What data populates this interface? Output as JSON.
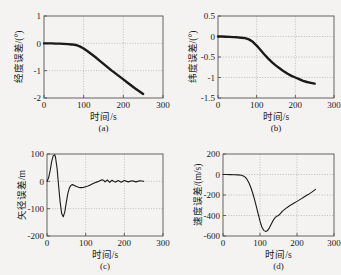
{
  "figure": {
    "background": "#f4f3f1",
    "curve_color": "#1a1a1a",
    "grid_color": "#9a9a9a",
    "axis_color": "#555555",
    "xlabel": "时间/s",
    "panels": [
      "a",
      "b",
      "c",
      "d"
    ]
  },
  "chart_data": [
    {
      "type": "line",
      "panel": "(a)",
      "title": "",
      "xlabel": "时间/s",
      "ylabel": "经度误差/(°)",
      "xlim": [
        0,
        300
      ],
      "ylim": [
        -2,
        1
      ],
      "xticks": [
        0,
        100,
        200,
        300
      ],
      "yticks": [
        -2,
        -1,
        0,
        1
      ],
      "xticklabels": [
        "0",
        "100",
        "200",
        "300"
      ],
      "yticklabels": [
        "-2",
        "-1",
        "0",
        "1"
      ],
      "grid": true,
      "legend": "none",
      "series": [
        {
          "name": "经度误差",
          "x": [
            0,
            10,
            20,
            30,
            40,
            50,
            60,
            70,
            80,
            90,
            100,
            110,
            120,
            130,
            140,
            150,
            160,
            170,
            180,
            190,
            200,
            210,
            220,
            230,
            240,
            250
          ],
          "values": [
            0,
            0,
            0,
            -0.01,
            -0.01,
            -0.02,
            -0.03,
            -0.04,
            -0.06,
            -0.11,
            -0.19,
            -0.29,
            -0.4,
            -0.51,
            -0.63,
            -0.75,
            -0.87,
            -0.99,
            -1.1,
            -1.21,
            -1.32,
            -1.43,
            -1.54,
            -1.65,
            -1.75,
            -1.85
          ]
        }
      ]
    },
    {
      "type": "line",
      "panel": "(b)",
      "title": "",
      "xlabel": "时间/s",
      "ylabel": "纬度误差/(°)",
      "xlim": [
        0,
        300
      ],
      "ylim": [
        -1.5,
        0.5
      ],
      "xticks": [
        0,
        100,
        200,
        300
      ],
      "yticks": [
        -1.5,
        -1,
        -0.5,
        0,
        0.5
      ],
      "xticklabels": [
        "0",
        "100",
        "200",
        "300"
      ],
      "yticklabels": [
        "-1.5",
        "-1",
        "-0.5",
        "0",
        "0.5"
      ],
      "grid": true,
      "legend": "none",
      "series": [
        {
          "name": "纬度误差",
          "x": [
            0,
            10,
            20,
            30,
            40,
            50,
            60,
            70,
            80,
            90,
            100,
            110,
            120,
            130,
            140,
            150,
            160,
            170,
            180,
            190,
            200,
            210,
            220,
            230,
            240,
            250
          ],
          "values": [
            0,
            0,
            -0.005,
            -0.01,
            -0.015,
            -0.02,
            -0.03,
            -0.04,
            -0.07,
            -0.13,
            -0.22,
            -0.33,
            -0.44,
            -0.54,
            -0.63,
            -0.71,
            -0.78,
            -0.85,
            -0.91,
            -0.96,
            -1.0,
            -1.04,
            -1.08,
            -1.11,
            -1.13,
            -1.15
          ]
        }
      ]
    },
    {
      "type": "line",
      "panel": "(c)",
      "title": "",
      "xlabel": "时间/s",
      "ylabel": "矢径误差/m",
      "xlim": [
        0,
        300
      ],
      "ylim": [
        -200,
        100
      ],
      "xticks": [
        0,
        100,
        200,
        300
      ],
      "yticks": [
        -200,
        -100,
        0,
        100
      ],
      "xticklabels": [
        "0",
        "100",
        "200",
        "300"
      ],
      "yticklabels": [
        "-200",
        "-100",
        "0",
        "100"
      ],
      "grid": true,
      "legend": "none",
      "series": [
        {
          "name": "矢径误差",
          "x": [
            0,
            4,
            8,
            12,
            16,
            20,
            22,
            26,
            30,
            34,
            38,
            42,
            46,
            50,
            54,
            58,
            62,
            66,
            70,
            76,
            82,
            88,
            94,
            100,
            106,
            112,
            118,
            124,
            130,
            134,
            138,
            142,
            146,
            150,
            156,
            162,
            168,
            176,
            184,
            192,
            200,
            210,
            220,
            230,
            240,
            250
          ],
          "values": [
            0,
            12,
            38,
            72,
            93,
            97,
            88,
            48,
            -16,
            -76,
            -118,
            -130,
            -112,
            -76,
            -44,
            -24,
            -14,
            -12,
            -14,
            -19,
            -22,
            -23,
            -22,
            -20,
            -17,
            -13,
            -9,
            -5,
            -2,
            0,
            3,
            6,
            4,
            -2,
            5,
            -4,
            4,
            -3,
            3,
            -3,
            3,
            -2,
            2,
            -2,
            2,
            0
          ]
        }
      ]
    },
    {
      "type": "line",
      "panel": "(d)",
      "title": "",
      "xlabel": "时间/s",
      "ylabel": "速度误差/(m/s)",
      "xlim": [
        0,
        300
      ],
      "ylim": [
        -600,
        200
      ],
      "xticks": [
        0,
        100,
        200,
        300
      ],
      "yticks": [
        -600,
        -400,
        -200,
        0,
        200
      ],
      "xticklabels": [
        "0",
        "100",
        "200",
        "300"
      ],
      "yticklabels": [
        "-600",
        "-400",
        "-200",
        "0",
        "200"
      ],
      "grid": true,
      "legend": "none",
      "series": [
        {
          "name": "速度误差",
          "x": [
            0,
            10,
            20,
            30,
            40,
            50,
            55,
            60,
            65,
            70,
            75,
            80,
            85,
            90,
            95,
            100,
            105,
            110,
            115,
            120,
            125,
            130,
            135,
            140,
            145,
            150,
            155,
            160,
            170,
            180,
            190,
            200,
            210,
            220,
            230,
            240,
            250
          ],
          "values": [
            0,
            0,
            -1,
            -2,
            -4,
            -8,
            -14,
            -26,
            -48,
            -80,
            -124,
            -178,
            -240,
            -310,
            -385,
            -455,
            -512,
            -545,
            -555,
            -548,
            -523,
            -488,
            -452,
            -424,
            -408,
            -400,
            -382,
            -360,
            -330,
            -305,
            -283,
            -262,
            -240,
            -218,
            -196,
            -172,
            -145
          ]
        }
      ]
    }
  ]
}
